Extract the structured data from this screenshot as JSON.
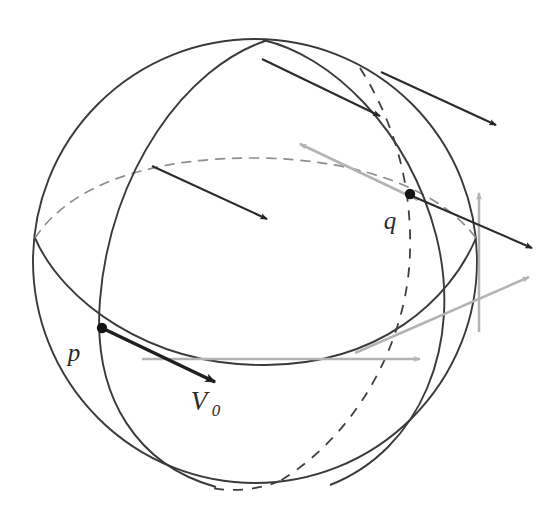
{
  "figure": {
    "kind": "geometry-diagram",
    "background_color": "#ffffff",
    "width": 555,
    "height": 509
  },
  "colors": {
    "stroke_dark": "#333333",
    "stroke_dashed": "#4a4a4a",
    "arrow_dark": "#262626",
    "arrow_light": "#b3b3b3",
    "point_fill": "#1a1a1a",
    "label_fill": "#2b2b2b"
  },
  "sphere": {
    "center_x": 255,
    "center_y": 261,
    "radius": 222,
    "outline_style": "solid"
  },
  "labels": {
    "p": "p",
    "q": "q",
    "v0_base": "V",
    "v0_sub": "0"
  },
  "points": [
    {
      "name": "p",
      "x": 102,
      "y": 328,
      "label": "p",
      "label_x": 76,
      "label_y": 360
    },
    {
      "name": "q",
      "x": 410,
      "y": 194,
      "label": "q",
      "label_x": 388,
      "label_y": 228
    }
  ],
  "curves": [
    {
      "name": "sphere-outline",
      "style": "solid"
    },
    {
      "name": "meridian-front-left",
      "style": "solid"
    },
    {
      "name": "meridian-front-right",
      "style": "solid"
    },
    {
      "name": "meridian-back-dashed",
      "style": "dashed"
    },
    {
      "name": "equator-front",
      "style": "solid"
    },
    {
      "name": "equator-back-dashed",
      "style": "dashed"
    }
  ],
  "vectors": [
    {
      "name": "v0-at-p",
      "color": "dark",
      "weight": "bold",
      "x1": 104,
      "y1": 329,
      "x2": 213,
      "y2": 381,
      "label": "V0"
    },
    {
      "name": "transported-upper-left",
      "color": "dark",
      "weight": "normal",
      "x1": 152,
      "y1": 166,
      "x2": 266,
      "y2": 218
    },
    {
      "name": "transported-top",
      "color": "dark",
      "weight": "normal",
      "x1": 263,
      "y1": 60,
      "x2": 378,
      "y2": 115
    },
    {
      "name": "transported-top-right",
      "color": "dark",
      "weight": "normal",
      "x1": 382,
      "y1": 73,
      "x2": 494,
      "y2": 124
    },
    {
      "name": "transported-at-q",
      "color": "dark",
      "weight": "normal",
      "x1": 412,
      "y1": 195,
      "x2": 530,
      "y2": 247
    },
    {
      "name": "gray-up-left",
      "color": "light",
      "weight": "normal",
      "x1": 418,
      "y1": 200,
      "x2": 300,
      "y2": 144
    },
    {
      "name": "gray-vertical",
      "color": "light",
      "weight": "normal",
      "x1": 479,
      "y1": 330,
      "x2": 479,
      "y2": 192
    },
    {
      "name": "gray-up-right",
      "color": "light",
      "weight": "normal",
      "x1": 357,
      "y1": 352,
      "x2": 528,
      "y2": 276
    },
    {
      "name": "gray-horizontal",
      "color": "light",
      "weight": "normal",
      "x1": 146,
      "y1": 359,
      "x2": 419,
      "y2": 359
    }
  ]
}
